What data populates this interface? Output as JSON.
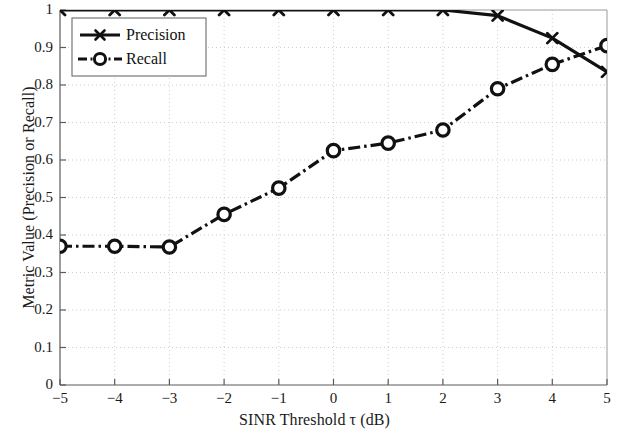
{
  "chart_data": {
    "type": "line",
    "title": "",
    "subtitle": "",
    "xlabel": "SINR Threshold τ (dB)",
    "ylabel": "Metric Value (Precision or Recall)",
    "x": [
      -5,
      -4,
      -3,
      -2,
      -1,
      0,
      1,
      2,
      3,
      4,
      5
    ],
    "xlim": [
      -5,
      5
    ],
    "ylim": [
      0,
      1
    ],
    "xticks": [
      -5,
      -4,
      -3,
      -2,
      -1,
      0,
      1,
      2,
      3,
      4,
      5
    ],
    "xtick_labels": [
      "−5",
      "−4",
      "−3",
      "−2",
      "−1",
      "0",
      "1",
      "2",
      "3",
      "4",
      "5"
    ],
    "yticks": [
      0,
      0.1,
      0.2,
      0.3,
      0.4,
      0.5,
      0.6,
      0.7,
      0.8,
      0.9,
      1
    ],
    "ytick_labels": [
      "0",
      "0.1",
      "0.2",
      "0.3",
      "0.4",
      "0.5",
      "0.6",
      "0.7",
      "0.8",
      "0.9",
      "1"
    ],
    "grid": true,
    "grid_style": "dotted",
    "grid_color": "#cfcfcf",
    "legend_position": "upper left",
    "series": [
      {
        "name": "Precision",
        "marker": "x",
        "linestyle": "solid",
        "color": "#111111",
        "values": [
          1.0,
          1.0,
          1.0,
          1.0,
          1.0,
          1.0,
          1.0,
          1.0,
          0.985,
          0.925,
          0.835
        ]
      },
      {
        "name": "Recall",
        "marker": "o",
        "linestyle": "dashdot",
        "color": "#111111",
        "values": [
          0.37,
          0.37,
          0.368,
          0.455,
          0.525,
          0.625,
          0.645,
          0.68,
          0.79,
          0.855,
          0.905
        ]
      }
    ]
  },
  "legend": {
    "entries": [
      {
        "label": "Precision"
      },
      {
        "label": "Recall"
      }
    ]
  },
  "colors": {
    "axis": "#5a5a5a",
    "line": "#111111",
    "grid": "#cfcfcf",
    "background": "#ffffff"
  }
}
